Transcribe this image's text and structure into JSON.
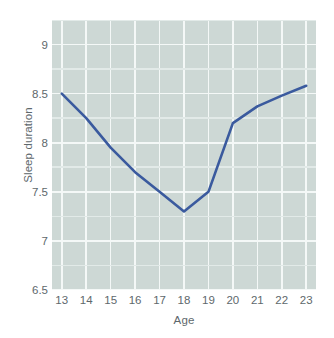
{
  "chart_data": {
    "type": "line",
    "title": "",
    "xlabel": "Age",
    "ylabel": "Sleep duration",
    "x": [
      13,
      14,
      15,
      16,
      17,
      18,
      19,
      20,
      21,
      22,
      23
    ],
    "values": [
      8.5,
      8.25,
      7.95,
      7.7,
      7.5,
      7.3,
      7.5,
      8.2,
      8.37,
      8.48,
      8.58
    ],
    "series": [
      {
        "name": "Sleep duration",
        "values": [
          8.5,
          8.25,
          7.95,
          7.7,
          7.5,
          7.3,
          7.5,
          8.2,
          8.37,
          8.48,
          8.58
        ],
        "color": "#3a5a9e"
      }
    ],
    "xtick_labels": [
      "13",
      "14",
      "15",
      "16",
      "17",
      "18",
      "19",
      "20",
      "21",
      "22",
      "23"
    ],
    "ytick_labels": [
      "6.5",
      "7",
      "7.5",
      "8",
      "8.5",
      "9"
    ],
    "ytick_values": [
      6.5,
      7,
      7.5,
      8,
      8.5,
      9
    ],
    "yminor_values": [
      6.75,
      7.25,
      7.75,
      8.25,
      8.75,
      9.25
    ],
    "xlim": [
      12.6,
      23.4
    ],
    "ylim": [
      6.5,
      9.25
    ],
    "grid": true,
    "legend": "none",
    "plot_background": "#cdd8d5",
    "grid_color": "#f4f8f7",
    "line_color": "#3a5a9e",
    "text_color": "#5e686c"
  }
}
